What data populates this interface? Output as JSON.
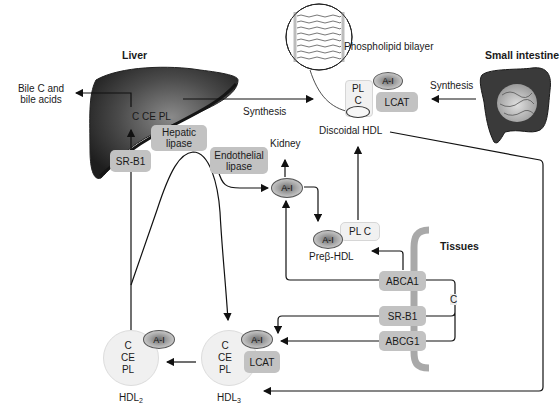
{
  "organs": {
    "liver": {
      "label": "Liver",
      "contents": "C CE PL"
    },
    "small_intestine": {
      "label": "Small intestine"
    },
    "tissues": {
      "label": "Tissues",
      "cholesterol": "C"
    },
    "kidney": {
      "label": "Kidney"
    }
  },
  "outputs": {
    "bile": {
      "line1": "Bile C and",
      "line2": "bile acids"
    }
  },
  "synthesis": {
    "liver_label": "Synthesis",
    "intestine_label": "Synthesis"
  },
  "phospholipid": {
    "label": "Phospholipid bilayer"
  },
  "discoidal_hdl": {
    "label": "Discoidal HDL",
    "pl": "PL",
    "c": "C",
    "apo": "A-I",
    "enzyme": "LCAT"
  },
  "enzymes": {
    "hepatic_lipase": {
      "line1": "Hepatic",
      "line2": "lipase"
    },
    "endothelial_lipase": {
      "line1": "Endothelial",
      "line2": "lipase"
    },
    "liver_receptor": "SR-B1"
  },
  "free_apo": {
    "label": "A-I"
  },
  "prebeta_hdl": {
    "apo": "A-I",
    "lipid": "PL C",
    "label_prefix": "Pre",
    "label_greek": "β",
    "label_suffix": "-HDL"
  },
  "transporters": {
    "abca1": "ABCA1",
    "srb1": "SR-B1",
    "abcg1": "ABCG1"
  },
  "hdl2": {
    "c": "C",
    "ce": "CE",
    "pl": "PL",
    "apo": "A-I",
    "label": "HDL",
    "label_sub": "2"
  },
  "hdl3": {
    "c": "C",
    "ce": "CE",
    "pl": "PL",
    "apo": "A-I",
    "enzyme": "LCAT",
    "label": "HDL",
    "label_sub": "3"
  },
  "colors": {
    "liver": "#3c3c3c",
    "box_gray": "#c2c2c2",
    "tissue_bg": "#ececec",
    "membrane": "#a9a9a9",
    "line": "#111111"
  }
}
